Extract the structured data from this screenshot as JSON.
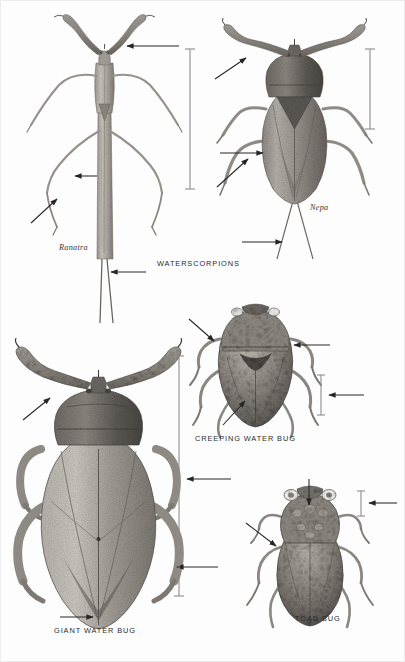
{
  "plate": {
    "title_label": "WATERSCORPIONS",
    "background_color": "#fdfdfd",
    "ink_color": "#2b2b2b",
    "width": 405,
    "height": 662
  },
  "figures": [
    {
      "id": "ranatra",
      "label": "Ranatra",
      "label_style": "italic-genus",
      "common_group": "WATERSCORPIONS",
      "position": "top-left"
    },
    {
      "id": "nepa",
      "label": "Nepa",
      "label_style": "italic-genus",
      "common_group": "WATERSCORPIONS",
      "position": "top-right"
    },
    {
      "id": "giant-water-bug",
      "label": "GIANT WATER BUG",
      "label_style": "caps",
      "position": "bottom-left"
    },
    {
      "id": "creeping-water-bug",
      "label": "CREEPING WATER BUG",
      "label_style": "caps",
      "position": "middle-right"
    },
    {
      "id": "toad-bug",
      "label": "TOAD BUG",
      "label_style": "caps",
      "position": "bottom-right"
    }
  ],
  "labels": {
    "ranatra": "Ranatra",
    "nepa": "Nepa",
    "waterscorpions": "WATERSCORPIONS",
    "giant_water_bug": "GIANT WATER BUG",
    "creeping_water_bug": "CREEPING WATER BUG",
    "toad_bug": "TOAD BUG"
  },
  "label_positions": {
    "ranatra": {
      "x": 58,
      "y": 247
    },
    "nepa": {
      "x": 309,
      "y": 207
    },
    "waterscorpions": {
      "x": 156,
      "y": 262
    },
    "giant_water_bug": {
      "x": 53,
      "y": 629
    },
    "creeping_water_bug": {
      "x": 194,
      "y": 437
    },
    "toad_bug": {
      "x": 294,
      "y": 617
    }
  },
  "scale_bars": [
    {
      "for": "ranatra",
      "x": 189,
      "y1": 48,
      "y2": 188
    },
    {
      "for": "nepa",
      "x": 369,
      "y1": 48,
      "y2": 128
    },
    {
      "for": "giant-water-bug",
      "x": 178,
      "y1": 355,
      "y2": 595
    },
    {
      "for": "creeping-water-bug",
      "x": 320,
      "y1": 374,
      "y2": 414
    },
    {
      "for": "toad-bug",
      "x": 360,
      "y1": 490,
      "y2": 515
    }
  ],
  "pointer_arrows": [
    {
      "for": "ranatra",
      "part": "raptorial-foreleg",
      "x1": 178,
      "y1": 45,
      "x2": 126,
      "y2": 45
    },
    {
      "for": "ranatra",
      "part": "abdomen",
      "x1": 96,
      "y1": 175,
      "x2": 74,
      "y2": 175
    },
    {
      "for": "ranatra",
      "part": "leg",
      "x1": 30,
      "y1": 222,
      "x2": 56,
      "y2": 198
    },
    {
      "for": "ranatra",
      "part": "breathing-tube",
      "x1": 145,
      "y1": 271,
      "x2": 110,
      "y2": 271
    },
    {
      "for": "nepa",
      "part": "raptorial-foreleg",
      "x1": 214,
      "y1": 78,
      "x2": 245,
      "y2": 57
    },
    {
      "for": "nepa",
      "part": "body-margin",
      "x1": 219,
      "y1": 152,
      "x2": 262,
      "y2": 152
    },
    {
      "for": "nepa",
      "part": "leg",
      "x1": 216,
      "y1": 186,
      "x2": 247,
      "y2": 158
    },
    {
      "for": "nepa",
      "part": "breathing-tube",
      "x1": 241,
      "y1": 241,
      "x2": 281,
      "y2": 241
    },
    {
      "for": "giant-water-bug",
      "part": "raptorial-foreleg",
      "x1": 22,
      "y1": 419,
      "x2": 49,
      "y2": 397
    },
    {
      "for": "giant-water-bug",
      "part": "body",
      "x1": 230,
      "y1": 478,
      "x2": 186,
      "y2": 478
    },
    {
      "for": "giant-water-bug",
      "part": "swimming-leg",
      "x1": 217,
      "y1": 566,
      "x2": 176,
      "y2": 566
    },
    {
      "for": "giant-water-bug",
      "part": "abdomen-tip",
      "x1": 59,
      "y1": 616,
      "x2": 92,
      "y2": 616
    },
    {
      "for": "creeping-water-bug",
      "part": "head",
      "x1": 188,
      "y1": 318,
      "x2": 213,
      "y2": 340
    },
    {
      "for": "creeping-water-bug",
      "part": "pronotum",
      "x1": 329,
      "y1": 344,
      "x2": 293,
      "y2": 344
    },
    {
      "for": "creeping-water-bug",
      "part": "scale",
      "x1": 363,
      "y1": 394,
      "x2": 328,
      "y2": 394
    },
    {
      "for": "creeping-water-bug",
      "part": "wing",
      "x1": 222,
      "y1": 424,
      "x2": 244,
      "y2": 400
    },
    {
      "for": "toad-bug",
      "part": "eye",
      "x1": 308,
      "y1": 478,
      "x2": 308,
      "y2": 504
    },
    {
      "for": "toad-bug",
      "part": "foreleg",
      "x1": 245,
      "y1": 522,
      "x2": 275,
      "y2": 545
    },
    {
      "for": "toad-bug",
      "part": "scale",
      "x1": 396,
      "y1": 502,
      "x2": 368,
      "y2": 502
    }
  ]
}
